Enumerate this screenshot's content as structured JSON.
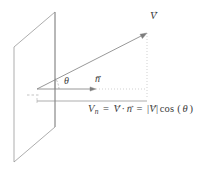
{
  "figure": {
    "type": "vector-projection-diagram",
    "background_color": "#ffffff",
    "stroke_color": "#777777",
    "text_color": "#3b3b3b"
  },
  "labels": {
    "vector_V": "V",
    "vector_n": "n",
    "angle_theta": "θ",
    "vector_arrow_glyph": "→"
  },
  "formula": {
    "lhs_symbol": "V",
    "lhs_subscript": "n",
    "equals_1": "=",
    "term_V": "V",
    "dot_operator": "·",
    "term_n": "n",
    "equals_2": "=",
    "abs_open": "|",
    "abs_V": "V",
    "abs_close": "|",
    "cos_function": "cos",
    "paren_open": "(",
    "cos_argument": "θ",
    "paren_close": ")",
    "plain_text": "V_n = V⃗ · n⃗ = |V⃗| cos(θ)"
  },
  "geometry": {
    "plane_polygon": "14,47 55,12 55,127 14,162",
    "origin": {
      "x": 37,
      "y": 89
    },
    "vector_V_tip": {
      "x": 147,
      "y": 33
    },
    "vector_n_tip": {
      "x": 96,
      "y": 89
    },
    "projection_line_y": 101,
    "projection_line_x_start": 37,
    "projection_line_x_end": 147,
    "dotted_drop_x": 147,
    "dotted_drop_y_start": 33,
    "dotted_drop_y_end": 99,
    "angle_arc_radius": 22
  }
}
